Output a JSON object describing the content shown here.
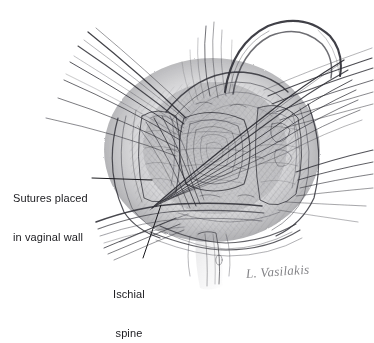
{
  "figure": {
    "kind": "pencil-medical-illustration",
    "background_color": "#ffffff",
    "ink_color": "#3a3a3e",
    "line_color": "#1b1b1f"
  },
  "labels": {
    "sutures": {
      "line1": "Sutures placed",
      "line2": "in vaginal wall",
      "leader": {
        "x1": 92,
        "y1": 178,
        "x2": 152,
        "y2": 180
      }
    },
    "ischial": {
      "line1": "Ischial",
      "line2": "spine",
      "leader": {
        "x1": 143,
        "y1": 258,
        "x2": 161,
        "y2": 205
      }
    }
  },
  "signature": {
    "text": "L. Vasilakis"
  }
}
